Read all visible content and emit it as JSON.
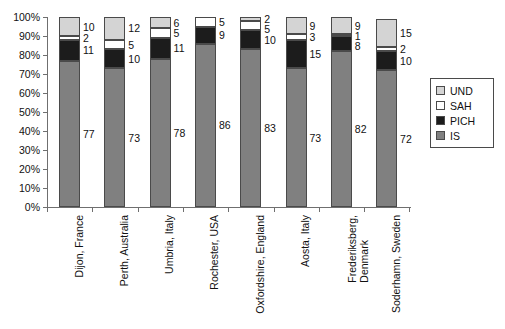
{
  "chart_data": {
    "type": "bar",
    "subtype": "stacked-percentage",
    "title": "",
    "xlabel": "",
    "ylabel": "",
    "ylim": [
      0,
      100
    ],
    "y_tick_labels": [
      "100%",
      "90%",
      "80%",
      "70%",
      "60%",
      "50%",
      "40%",
      "30%",
      "20%",
      "10%",
      "0%"
    ],
    "y_tick_values": [
      100,
      90,
      80,
      70,
      60,
      50,
      40,
      30,
      20,
      10,
      0
    ],
    "grid": false,
    "legend_position": "right",
    "categories": [
      "Dijon, France",
      "Perth, Australia",
      "Umbria, Italy",
      "Rochester, USA",
      "Oxfordshire, England",
      "Aosta, Italy",
      "Frederiksberg,\nDenmark",
      "Soderhamn, Sweden"
    ],
    "stack_order_bottom_to_top": [
      "IS",
      "PICH",
      "SAH",
      "UND"
    ],
    "series": [
      {
        "name": "IS",
        "color": "#808080",
        "values": [
          77,
          73,
          78,
          86,
          83,
          73,
          82,
          72
        ]
      },
      {
        "name": "PICH",
        "color": "#1c1c1c",
        "values": [
          11,
          10,
          11,
          9,
          10,
          15,
          8,
          10
        ]
      },
      {
        "name": "SAH",
        "color": "#ffffff",
        "values": [
          2,
          5,
          5,
          5,
          5,
          3,
          1,
          2
        ]
      },
      {
        "name": "UND",
        "color": "#d4d4d4",
        "values": [
          10,
          12,
          6,
          0,
          2,
          9,
          9,
          15
        ]
      }
    ],
    "data_labels": {
      "Dijon, France": {
        "UND": "10",
        "SAH": "2",
        "PICH": "11",
        "IS": "77"
      },
      "Perth, Australia": {
        "UND": "12",
        "SAH": "5",
        "PICH": "10",
        "IS": "73"
      },
      "Umbria, Italy": {
        "UND": "6",
        "SAH": "5",
        "PICH": "11",
        "IS": "78"
      },
      "Rochester, USA": {
        "UND": "",
        "SAH": "5",
        "PICH": "9",
        "IS": "86"
      },
      "Oxfordshire, England": {
        "UND": "2",
        "SAH": "5",
        "PICH": "10",
        "IS": "83"
      },
      "Aosta, Italy": {
        "UND": "9",
        "SAH": "3",
        "PICH": "15",
        "IS": "73"
      },
      "Frederiksberg,\nDenmark": {
        "UND": "9",
        "SAH": "1",
        "PICH": "8",
        "IS": "82"
      },
      "Soderhamn, Sweden": {
        "UND": "15",
        "SAH": "2",
        "PICH": "10",
        "IS": "72"
      }
    }
  },
  "legend": {
    "items": [
      {
        "label": "UND",
        "color": "#d4d4d4"
      },
      {
        "label": "SAH",
        "color": "#ffffff"
      },
      {
        "label": "PICH",
        "color": "#1c1c1c"
      },
      {
        "label": "IS",
        "color": "#808080"
      }
    ]
  }
}
